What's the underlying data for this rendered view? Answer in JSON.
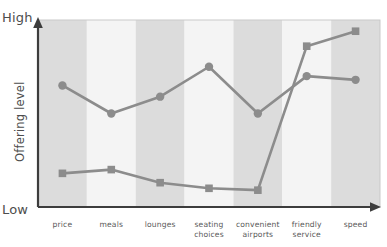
{
  "chart_data": {
    "type": "line",
    "title": "",
    "subtitle": "",
    "xlabel": "",
    "ylabel": "Offering level",
    "y_high_label": "High",
    "y_low_label": "Low",
    "grid": false,
    "legend": "none",
    "axis_scale": "qualitative",
    "ylim": [
      0,
      100
    ],
    "categories": [
      "price",
      "meals",
      "lounges",
      "seating choices",
      "convenient airports",
      "friendly service",
      "speed"
    ],
    "category_lines": [
      [
        "price"
      ],
      [
        "meals"
      ],
      [
        "lounges"
      ],
      [
        "seating",
        "choices"
      ],
      [
        "convenient",
        "airports"
      ],
      [
        "friendly",
        "service"
      ],
      [
        "speed"
      ]
    ],
    "series": [
      {
        "name": "series-circle",
        "marker": "circle",
        "color": "#8c8c8c",
        "values": [
          65,
          50,
          59,
          75,
          50,
          70,
          68
        ]
      },
      {
        "name": "series-square",
        "marker": "square",
        "color": "#8c8c8c",
        "values": [
          18,
          20,
          13,
          10,
          9,
          86,
          94
        ]
      }
    ],
    "band_colors": [
      "#dcdcdc",
      "#f4f4f4"
    ],
    "axis_color": "#3d3d3d",
    "plot_border_color": "#bfbfbf"
  },
  "layout": {
    "plot_left": 38,
    "plot_right": 380,
    "plot_top": 20,
    "plot_bottom": 207
  }
}
